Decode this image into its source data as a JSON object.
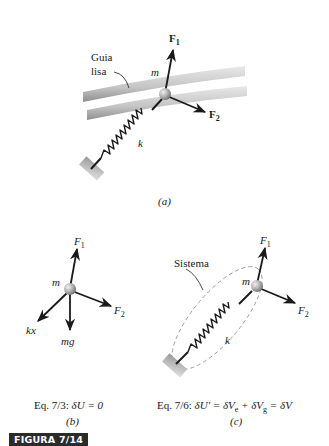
{
  "figure": {
    "label": "FIGURA 7/14",
    "badge_color": "#2b2b2b"
  },
  "panel_a": {
    "guide_label_line1": "Guia",
    "guide_label_line2": "lisa",
    "mass_label": "m",
    "spring_label": "k",
    "force1": {
      "symbol": "F",
      "subscript": "1"
    },
    "force2": {
      "symbol": "F",
      "subscript": "2"
    },
    "caption": "(a)"
  },
  "panel_b": {
    "mass_label": "m",
    "force1": {
      "symbol": "F",
      "subscript": "1"
    },
    "force2": {
      "symbol": "F",
      "subscript": "2"
    },
    "spring_force_label": "kx",
    "weight_label": "mg",
    "equation_prefix": "Eq. 7/3:",
    "equation": "δU = 0",
    "caption": "(b)"
  },
  "panel_c": {
    "system_label": "Sistema",
    "mass_label": "m",
    "spring_label": "k",
    "force1": {
      "symbol": "F",
      "subscript": "1"
    },
    "force2": {
      "symbol": "F",
      "subscript": "2"
    },
    "equation_prefix": "Eq. 7/6:",
    "equation_parts": [
      "δU' = δV",
      "e",
      " + δV",
      "g",
      " = δV"
    ],
    "caption": "(c)"
  },
  "colors": {
    "ink": "#1a1a1a",
    "rail": "#bdbdbd",
    "ball": "#a8a8a8",
    "dashed": "#9a9a9a"
  }
}
